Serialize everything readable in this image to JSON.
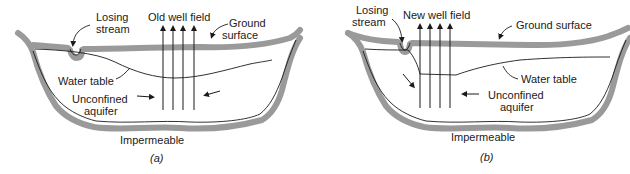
{
  "figure": {
    "panels": [
      {
        "id": "a",
        "caption": "(a)",
        "labels": {
          "losing_stream": [
            "Losing",
            "stream"
          ],
          "well_field": "Old well field",
          "ground_surface": [
            "Ground",
            "surface"
          ],
          "water_table": "Water table",
          "aquifer": [
            "Unconfined",
            "aquifer"
          ],
          "impermeable": "Impermeable"
        }
      },
      {
        "id": "b",
        "caption": "(b)",
        "labels": {
          "losing_stream": [
            "Losing",
            "stream"
          ],
          "well_field": "New well field",
          "ground_surface": "Ground surface",
          "water_table": "Water table",
          "aquifer": [
            "Unconfined",
            "aquifer"
          ],
          "impermeable": "Impermeable"
        }
      }
    ],
    "colors": {
      "band": "#9a9a9a",
      "line": "#1a1a1a",
      "background": "#ffffff"
    }
  }
}
